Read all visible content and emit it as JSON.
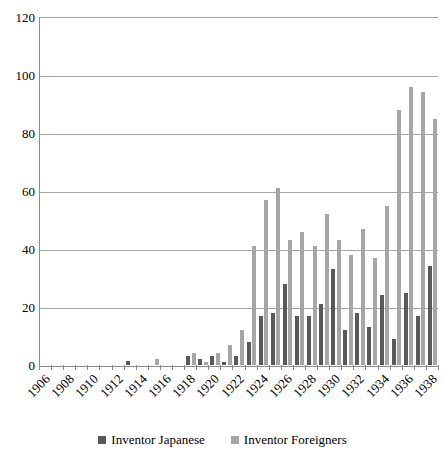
{
  "chart_data": {
    "type": "bar",
    "title": "",
    "subtitle": "",
    "xlabel": "",
    "ylabel": "",
    "ylim": [
      0,
      120
    ],
    "ytick_step": 20,
    "yticks": [
      120,
      100,
      80,
      60,
      40,
      20,
      0
    ],
    "grid": true,
    "legend_position": "bottom",
    "categories": [
      "1906",
      "1907",
      "1908",
      "1909",
      "1910",
      "1911",
      "1912",
      "1913",
      "1914",
      "1915",
      "1916",
      "1917",
      "1918",
      "1919",
      "1920",
      "1921",
      "1922",
      "1923",
      "1924",
      "1925",
      "1926",
      "1927",
      "1928",
      "1929",
      "1930",
      "1931",
      "1932",
      "1933",
      "1934",
      "1935",
      "1936",
      "1937",
      "1938"
    ],
    "xtick_labels": [
      "1906",
      "1908",
      "1910",
      "1912",
      "1914",
      "1916",
      "1918",
      "1920",
      "1922",
      "1924",
      "1926",
      "1928",
      "1930",
      "1932",
      "1934",
      "1936",
      "1938"
    ],
    "series": [
      {
        "name": "Inventor Japanese",
        "color": "#595959",
        "values": [
          0,
          0,
          0,
          0,
          0,
          0,
          0,
          1.5,
          0,
          0,
          0,
          0,
          3,
          2,
          3,
          1,
          3,
          8,
          17,
          18,
          28,
          17,
          17,
          21,
          33,
          12,
          18,
          13,
          24,
          9,
          25,
          17,
          34
        ]
      },
      {
        "name": "Inventor Foreigners",
        "color": "#a6a6a6",
        "values": [
          0,
          0,
          0,
          0,
          0,
          0,
          0,
          0,
          0,
          2,
          0,
          0,
          4,
          1,
          4,
          7,
          12,
          41,
          57,
          61,
          43,
          46,
          41,
          52,
          43,
          38,
          47,
          37,
          55,
          88,
          96,
          94,
          85
        ]
      }
    ]
  },
  "legend": {
    "entries": [
      {
        "label": "Inventor Japanese",
        "color": "#595959"
      },
      {
        "label": "Inventor Foreigners",
        "color": "#a6a6a6"
      }
    ]
  },
  "colors": {
    "japanese": "#595959",
    "foreigners": "#a6a6a6",
    "gridline": "#a6a6a6",
    "axis": "#8c8c8c",
    "background": "#ffffff"
  }
}
